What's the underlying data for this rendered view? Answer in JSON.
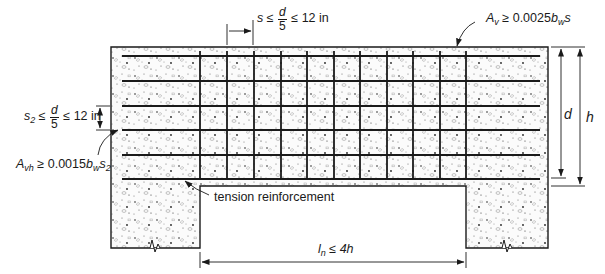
{
  "figure": {
    "type": "deep beam reinforcement detail",
    "labels": {
      "stirrup_spacing": {
        "var": "s",
        "op1": "≤",
        "num": "d",
        "den": "5",
        "op2": "≤",
        "limit": "12 in"
      },
      "horizontal_spacing": {
        "var": "s",
        "var_sub": "2",
        "op1": "≤",
        "num": "d",
        "den": "5",
        "op2": "≤",
        "limit": "12 in"
      },
      "vertical_area": {
        "var": "A",
        "var_sub": "v",
        "op": "≥",
        "coef": "0.0025",
        "b": "b",
        "b_sub": "w",
        "s": "s"
      },
      "horizontal_area": {
        "var": "A",
        "var_sub": "vh",
        "op": "≥",
        "coef": "0.0015",
        "b": "b",
        "b_sub": "w",
        "s": "s",
        "s_sub": "2"
      },
      "tension_reinforcement": "tension reinforcement",
      "clear_span": {
        "var": "l",
        "var_sub": "n",
        "op": "≤",
        "limit": "4h"
      },
      "effective_depth": "d",
      "overall_depth": "h"
    },
    "geometry": {
      "beam": {
        "left": 111,
        "right": 548,
        "top": 47,
        "soffit": 186
      },
      "left_support": {
        "left": 111,
        "right": 200,
        "bottom": 248
      },
      "right_support": {
        "left": 466,
        "right": 548,
        "bottom": 248
      },
      "horizontal_bars_y": [
        56,
        81,
        106,
        130,
        155,
        179
      ],
      "horizontal_bars_x": [
        122,
        540
      ],
      "vertical_stirrups_x": [
        200,
        227,
        254,
        281,
        307,
        334,
        360,
        387,
        413,
        440,
        466
      ],
      "stirrup_y": [
        51,
        179
      ]
    },
    "colors": {
      "line": "#1a1a1a",
      "concrete_bg": "#f7f7f7",
      "aggregate": "#8a8a8a"
    }
  }
}
